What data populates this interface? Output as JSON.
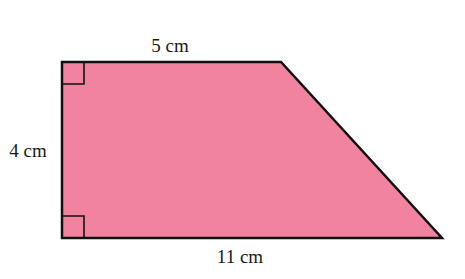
{
  "figure": {
    "shape": "right trapezoid",
    "fill_color": "#F2839E",
    "stroke_color": "#111111",
    "vertices": {
      "top_left": [
        62,
        62
      ],
      "top_right": [
        281,
        62
      ],
      "bottom_right": [
        442,
        238
      ],
      "bottom_left": [
        62,
        238
      ]
    },
    "right_angle_markers": [
      "top-left",
      "bottom-left"
    ]
  },
  "labels": {
    "top": "5 cm",
    "left": "4 cm",
    "bottom": "11 cm"
  }
}
